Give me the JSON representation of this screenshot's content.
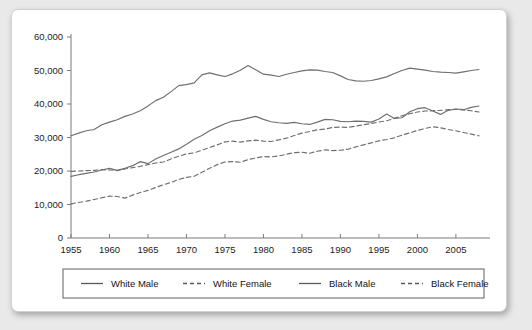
{
  "chart_data": {
    "type": "line",
    "title": "",
    "subtitle": "",
    "xlabel": "",
    "ylabel": "",
    "xlim": [
      1955,
      2008
    ],
    "ylim": [
      0,
      60000
    ],
    "grid": false,
    "legend_position": "bottom",
    "x_tick_labels": [
      "1955",
      "1960",
      "1965",
      "1970",
      "1975",
      "1980",
      "1985",
      "1990",
      "1995",
      "2000",
      "2005"
    ],
    "x_ticks": [
      1955,
      1960,
      1965,
      1970,
      1975,
      1980,
      1985,
      1990,
      1995,
      2000,
      2005
    ],
    "y_tick_labels": [
      "0",
      "10,000",
      "20,000",
      "30,000",
      "40,000",
      "50,000",
      "60,000"
    ],
    "y_ticks": [
      0,
      10000,
      20000,
      30000,
      40000,
      50000,
      60000
    ],
    "x": [
      1955,
      1956,
      1957,
      1958,
      1959,
      1960,
      1961,
      1962,
      1963,
      1964,
      1965,
      1966,
      1967,
      1968,
      1969,
      1970,
      1971,
      1972,
      1973,
      1974,
      1975,
      1976,
      1977,
      1978,
      1979,
      1980,
      1981,
      1982,
      1983,
      1984,
      1985,
      1986,
      1987,
      1988,
      1989,
      1990,
      1991,
      1992,
      1993,
      1994,
      1995,
      1996,
      1997,
      1998,
      1999,
      2000,
      2001,
      2002,
      2003,
      2004,
      2005,
      2006,
      2007,
      2008
    ],
    "series": [
      {
        "name": "White Male",
        "style": "solid",
        "color": "#6f6f6f",
        "values": [
          30500,
          31300,
          32000,
          32400,
          33800,
          34600,
          35300,
          36300,
          37000,
          38000,
          39400,
          41000,
          42000,
          43700,
          45500,
          45800,
          46300,
          48700,
          49300,
          48700,
          48200,
          49000,
          50100,
          51500,
          50200,
          48900,
          48600,
          48200,
          48900,
          49400,
          49900,
          50200,
          50100,
          49700,
          49400,
          48400,
          47300,
          46900,
          46800,
          47000,
          47500,
          48100,
          49100,
          50000,
          50700,
          50400,
          50100,
          49700,
          49500,
          49400,
          49200,
          49600,
          50000,
          50300
        ]
      },
      {
        "name": "White Female",
        "style": "dashed",
        "color": "#6f6f6f",
        "values": [
          19900,
          20000,
          20100,
          20200,
          20400,
          20300,
          20100,
          20600,
          21000,
          21400,
          21900,
          22400,
          22700,
          23600,
          24400,
          25100,
          25400,
          26200,
          27000,
          27800,
          28700,
          28900,
          28600,
          29000,
          29200,
          28900,
          28800,
          29300,
          29800,
          30600,
          31300,
          31800,
          32300,
          32500,
          33000,
          33100,
          33000,
          33400,
          33800,
          34200,
          34600,
          35000,
          35700,
          36500,
          37100,
          37600,
          37900,
          38000,
          38100,
          38300,
          38400,
          38200,
          38000,
          37600
        ]
      },
      {
        "name": "Black Male",
        "style": "solid",
        "color": "#6f6f6f",
        "values": [
          18400,
          18900,
          19300,
          19700,
          20300,
          20800,
          20200,
          20800,
          21600,
          22800,
          22200,
          23600,
          24600,
          25600,
          26600,
          28000,
          29500,
          30600,
          32000,
          33100,
          34100,
          34900,
          35200,
          35800,
          36300,
          35400,
          34700,
          34400,
          34200,
          34500,
          34100,
          33900,
          34600,
          35400,
          35300,
          34800,
          34700,
          34900,
          34800,
          34600,
          35500,
          37000,
          35700,
          35900,
          37700,
          38600,
          38900,
          37900,
          36900,
          38100,
          38500,
          38300,
          39000,
          39400
        ]
      },
      {
        "name": "Black Female",
        "style": "dashed",
        "color": "#6f6f6f",
        "values": [
          10200,
          10600,
          11000,
          11500,
          12000,
          12500,
          12400,
          11900,
          12800,
          13600,
          14200,
          15100,
          15900,
          16600,
          17500,
          18100,
          18400,
          19600,
          20800,
          21900,
          22700,
          22800,
          22600,
          23400,
          23900,
          24300,
          24200,
          24500,
          25000,
          25500,
          25600,
          25300,
          25900,
          26300,
          26100,
          26200,
          26500,
          27200,
          27800,
          28400,
          29000,
          29400,
          29900,
          30700,
          31400,
          32100,
          32700,
          33200,
          32900,
          32400,
          32000,
          31500,
          31000,
          30500
        ]
      }
    ],
    "legend": [
      {
        "label": "White Male",
        "style": "solid"
      },
      {
        "label": "White Female",
        "style": "dashed"
      },
      {
        "label": "Black Male",
        "style": "solid"
      },
      {
        "label": "Black Female",
        "style": "dashed"
      }
    ]
  }
}
